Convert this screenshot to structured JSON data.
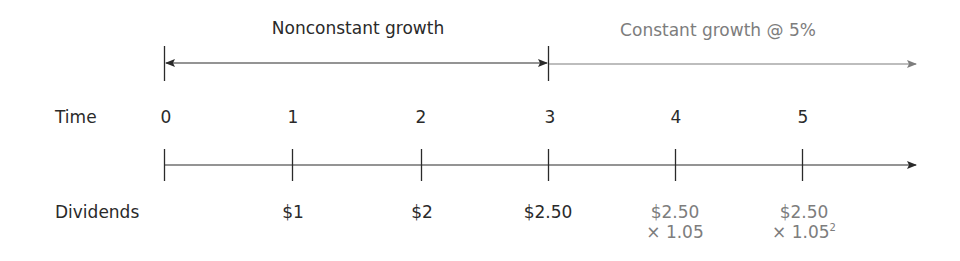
{
  "header": {
    "nonconstant_label": "Nonconstant growth",
    "constant_label": "Constant growth @ 5%"
  },
  "rows": {
    "time_label": "Time",
    "dividends_label": "Dividends"
  },
  "periods": [
    {
      "t": "0",
      "dividend": "",
      "dividend_line2": "",
      "dividend_exp": ""
    },
    {
      "t": "1",
      "dividend": "$1",
      "dividend_line2": "",
      "dividend_exp": ""
    },
    {
      "t": "2",
      "dividend": "$2",
      "dividend_line2": "",
      "dividend_exp": ""
    },
    {
      "t": "3",
      "dividend": "$2.50",
      "dividend_line2": "",
      "dividend_exp": ""
    },
    {
      "t": "4",
      "dividend": "$2.50",
      "dividend_line2": "× 1.05",
      "dividend_exp": ""
    },
    {
      "t": "5",
      "dividend": "$2.50",
      "dividend_line2": "× 1.05",
      "dividend_exp": "2"
    }
  ],
  "colors": {
    "dark": "#2a2a2a",
    "gray": "#7d7d7d"
  }
}
